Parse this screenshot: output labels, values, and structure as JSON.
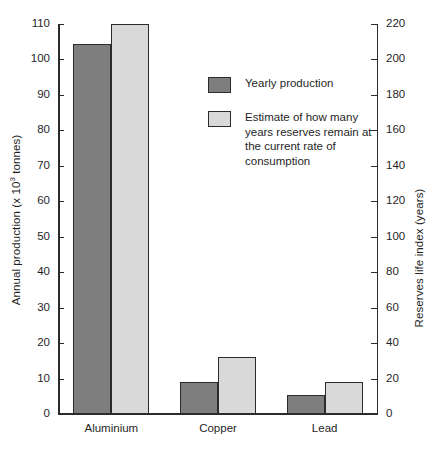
{
  "chart_data": {
    "type": "bar",
    "title": "",
    "categories": [
      "Aluminium",
      "Copper",
      "Lead"
    ],
    "series": [
      {
        "name": "Yearly production",
        "axis": "left",
        "color": "#7e7e7e",
        "values": [
          104.5,
          9,
          5.5
        ]
      },
      {
        "name": "Estimate of how many years reserves remain at the current rate of consumption",
        "axis": "right",
        "color": "#d9d9d9",
        "values": [
          220,
          32,
          18
        ]
      }
    ],
    "xlabel": "",
    "ylabel": "Annual production (x 10³ tonnes)",
    "ylabel_right": "Reserves life index (years)",
    "ylim": [
      0,
      110
    ],
    "ylim_right": [
      0,
      220
    ],
    "yticks": [
      0,
      10,
      20,
      30,
      40,
      50,
      60,
      70,
      80,
      90,
      100,
      110
    ],
    "yticks_right": [
      0,
      20,
      40,
      60,
      80,
      100,
      120,
      140,
      160,
      180,
      200,
      220
    ],
    "grid": false,
    "legend_position": "upper center inside"
  },
  "axes": {
    "left_title_main": "Annual production (x 10",
    "left_title_sup": "3",
    "left_title_tail": " tonnes)",
    "right_title": "Reserves life index (years)"
  },
  "legend": {
    "items": [
      {
        "label": "Yearly production",
        "color": "#7e7e7e"
      },
      {
        "label": "Estimate of how many years reserves remain at the current rate of consumption",
        "color": "#d9d9d9"
      }
    ]
  }
}
